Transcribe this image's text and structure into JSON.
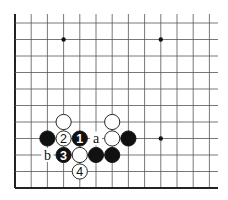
{
  "diagram": {
    "type": "go-board-fragment",
    "grid": {
      "origin_x": 15,
      "origin_y": 23,
      "dx": 16.2,
      "dy": 16.5,
      "cols": 13,
      "rows": 11,
      "line_color": "#555555",
      "edge_color": "#222222",
      "open_top": true,
      "open_right": true
    },
    "star_points": [
      [
        3,
        1
      ],
      [
        9,
        1
      ],
      [
        9,
        7
      ]
    ],
    "stones": [
      {
        "col": 3,
        "row": 6,
        "color": "white",
        "label": ""
      },
      {
        "col": 6,
        "row": 6,
        "color": "white",
        "label": ""
      },
      {
        "col": 2,
        "row": 7,
        "color": "black",
        "label": ""
      },
      {
        "col": 3,
        "row": 7,
        "color": "white",
        "label": "2"
      },
      {
        "col": 4,
        "row": 7,
        "color": "black",
        "label": "1"
      },
      {
        "col": 6,
        "row": 7,
        "color": "white",
        "label": ""
      },
      {
        "col": 7,
        "row": 7,
        "color": "black",
        "label": ""
      },
      {
        "col": 3,
        "row": 8,
        "color": "black",
        "label": "3"
      },
      {
        "col": 4,
        "row": 8,
        "color": "white",
        "label": ""
      },
      {
        "col": 5,
        "row": 8,
        "color": "black",
        "label": ""
      },
      {
        "col": 6,
        "row": 8,
        "color": "black",
        "label": ""
      },
      {
        "col": 4,
        "row": 9,
        "color": "white",
        "label": "4"
      }
    ],
    "letters": [
      {
        "col": 5,
        "row": 7,
        "text": "a"
      },
      {
        "col": 2,
        "row": 8,
        "text": "b"
      }
    ]
  }
}
